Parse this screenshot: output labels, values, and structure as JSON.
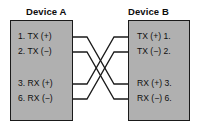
{
  "diagram": {
    "background_color": "#ffffff",
    "box_fill_color": "#b0b0b0",
    "line_color": "#1a1a1a"
  },
  "devices": [
    {
      "id": "device-a",
      "heading": "Device A",
      "side": "left",
      "pins": [
        {
          "number": "1.",
          "signal": "TX (+)",
          "label": "1. TX (+)"
        },
        {
          "number": "2.",
          "signal": "TX (−)",
          "label": "2. TX (−)"
        },
        {
          "number": "3.",
          "signal": "RX (+)",
          "label": "3. RX (+)"
        },
        {
          "number": "6.",
          "signal": "RX (−)",
          "label": "6. RX (−)"
        }
      ]
    },
    {
      "id": "device-b",
      "heading": "Device B",
      "side": "right",
      "pins": [
        {
          "number": "1.",
          "signal": "TX (+)",
          "label": "TX (+) 1."
        },
        {
          "number": "2.",
          "signal": "TX (−)",
          "label": "TX (−) 2."
        },
        {
          "number": "3.",
          "signal": "RX (+)",
          "label": "RX (+) 3."
        },
        {
          "number": "6.",
          "signal": "RX (−)",
          "label": "RX (−) 6."
        }
      ]
    }
  ],
  "connections": [
    {
      "id": "wire-a1-b3",
      "from": "Device A pin 1 TX (+)",
      "to": "Device B pin 3 RX (+)"
    },
    {
      "id": "wire-a2-b6",
      "from": "Device A pin 2 TX (−)",
      "to": "Device B pin 6 RX (−)"
    },
    {
      "id": "wire-a3-b1",
      "from": "Device A pin 3 RX (+)",
      "to": "Device B pin 1 TX (+)"
    },
    {
      "id": "wire-a6-b2",
      "from": "Device A pin 6 RX (−)",
      "to": "Device B pin 2 TX (−)"
    }
  ]
}
